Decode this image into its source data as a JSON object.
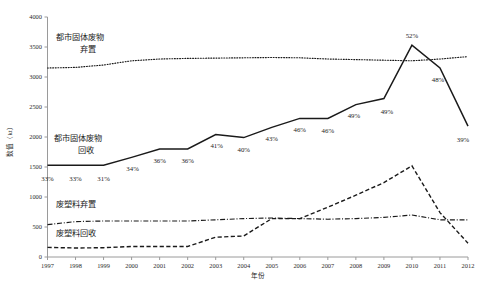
{
  "chart_data": {
    "type": "line",
    "title": "",
    "xlabel": "年份",
    "ylabel": "数值（kt）",
    "grid": false,
    "legend_position": "inline-labels",
    "xlim": [
      1997,
      2012
    ],
    "ylim": [
      0,
      4000
    ],
    "ytick_step": 500,
    "categories": [
      1997,
      1998,
      1999,
      2000,
      2001,
      2002,
      2003,
      2004,
      2005,
      2006,
      2007,
      2008,
      2009,
      2010,
      2011,
      2012
    ],
    "xtick_labels": [
      "1997",
      "1998",
      "1999",
      "2000",
      "2001",
      "2002",
      "2003",
      "2004",
      "2005",
      "2006",
      "2007",
      "2008",
      "2009",
      "2010",
      "2011",
      "2012"
    ],
    "ytick_labels": [
      "0",
      "500",
      "1000",
      "1500",
      "2000",
      "2500",
      "3000",
      "3500",
      "4000"
    ],
    "series": [
      {
        "name": "都市固体废物弃置",
        "style": "dotted",
        "values": [
          3150,
          3160,
          3200,
          3270,
          3300,
          3310,
          3315,
          3320,
          3325,
          3320,
          3300,
          3290,
          3280,
          3270,
          3300,
          3340
        ]
      },
      {
        "name": "都市固体废物回收",
        "style": "solid",
        "values": [
          1530,
          1530,
          1530,
          1660,
          1800,
          1800,
          2040,
          1990,
          2160,
          2310,
          2310,
          2540,
          2640,
          3530,
          3150,
          2180
        ]
      },
      {
        "name": "废塑料弃置",
        "style": "dash-dot",
        "values": [
          540,
          590,
          600,
          600,
          600,
          600,
          620,
          640,
          650,
          640,
          630,
          640,
          660,
          700,
          620,
          620
        ]
      },
      {
        "name": "废塑料回收",
        "style": "dashed",
        "values": [
          160,
          150,
          155,
          175,
          175,
          175,
          330,
          350,
          640,
          640,
          830,
          1030,
          1240,
          1520,
          740,
          230
        ]
      }
    ],
    "annotations": {
      "label": "回收率",
      "values": [
        "33%",
        "33%",
        "31%",
        "34%",
        "36%",
        "36%",
        "41%",
        "40%",
        "43%",
        "46%",
        "46%",
        "49%",
        "49%",
        "52%",
        "48%",
        "39%"
      ]
    },
    "inline_series_labels": [
      {
        "name": "msw-dispose",
        "lines": [
          "都市固体废物",
          "弃置"
        ]
      },
      {
        "name": "msw-recycle",
        "lines": [
          "都市固体废物",
          "回收"
        ]
      },
      {
        "name": "plastic-dispose",
        "lines": [
          "废塑料弃置"
        ]
      },
      {
        "name": "plastic-recycle",
        "lines": [
          "废塑料回收"
        ]
      }
    ]
  }
}
